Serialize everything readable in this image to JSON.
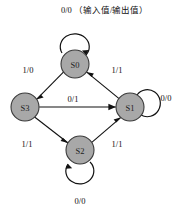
{
  "diagram": {
    "type": "state-transition-diagram",
    "legend": {
      "label": "0/0",
      "annotation": "（输入值/输出值）",
      "full_text": "0/0 （输入值/输出值）"
    },
    "node_fill_color": "#a8a8a8",
    "node_stroke_color": "#3a3a3a",
    "edge_color": "#111111",
    "states": [
      {
        "id": "S0",
        "label": "S0",
        "cx": 75,
        "cy": 64,
        "r": 14
      },
      {
        "id": "S3",
        "label": "S3",
        "cx": 25,
        "cy": 107,
        "r": 14
      },
      {
        "id": "S1",
        "label": "S1",
        "cx": 130,
        "cy": 107,
        "r": 14
      },
      {
        "id": "S2",
        "label": "S2",
        "cx": 80,
        "cy": 150,
        "r": 14
      }
    ],
    "transitions": [
      {
        "from": "S0",
        "to": "S0",
        "label": "0/0",
        "kind": "self-loop",
        "position": "top"
      },
      {
        "from": "S0",
        "to": "S3",
        "label": "1/0",
        "kind": "edge",
        "position": "upper-left"
      },
      {
        "from": "S1",
        "to": "S0",
        "label": "1/1",
        "kind": "edge",
        "position": "upper-right"
      },
      {
        "from": "S3",
        "to": "S1",
        "label": "0/1",
        "kind": "edge",
        "position": "middle-horizontal"
      },
      {
        "from": "S3",
        "to": "S2",
        "label": "1/1",
        "kind": "edge",
        "position": "lower-left"
      },
      {
        "from": "S2",
        "to": "S1",
        "label": "1/1",
        "kind": "edge",
        "position": "lower-right"
      },
      {
        "from": "S1",
        "to": "S1",
        "label": "0/0",
        "kind": "self-loop",
        "position": "right"
      },
      {
        "from": "S2",
        "to": "S2",
        "label": "0/0",
        "kind": "self-loop",
        "position": "bottom"
      }
    ],
    "edge_labels": {
      "s0_self": "0/0",
      "s0_to_s3": "1/0",
      "s1_to_s0": "1/1",
      "s3_to_s1": "0/1",
      "s3_to_s2": "1/1",
      "s2_to_s1": "1/1",
      "s1_self": "0/0",
      "s2_self": "0/0"
    },
    "state_labels": {
      "s0": "S0",
      "s1": "S1",
      "s2": "S2",
      "s3": "S3"
    }
  }
}
